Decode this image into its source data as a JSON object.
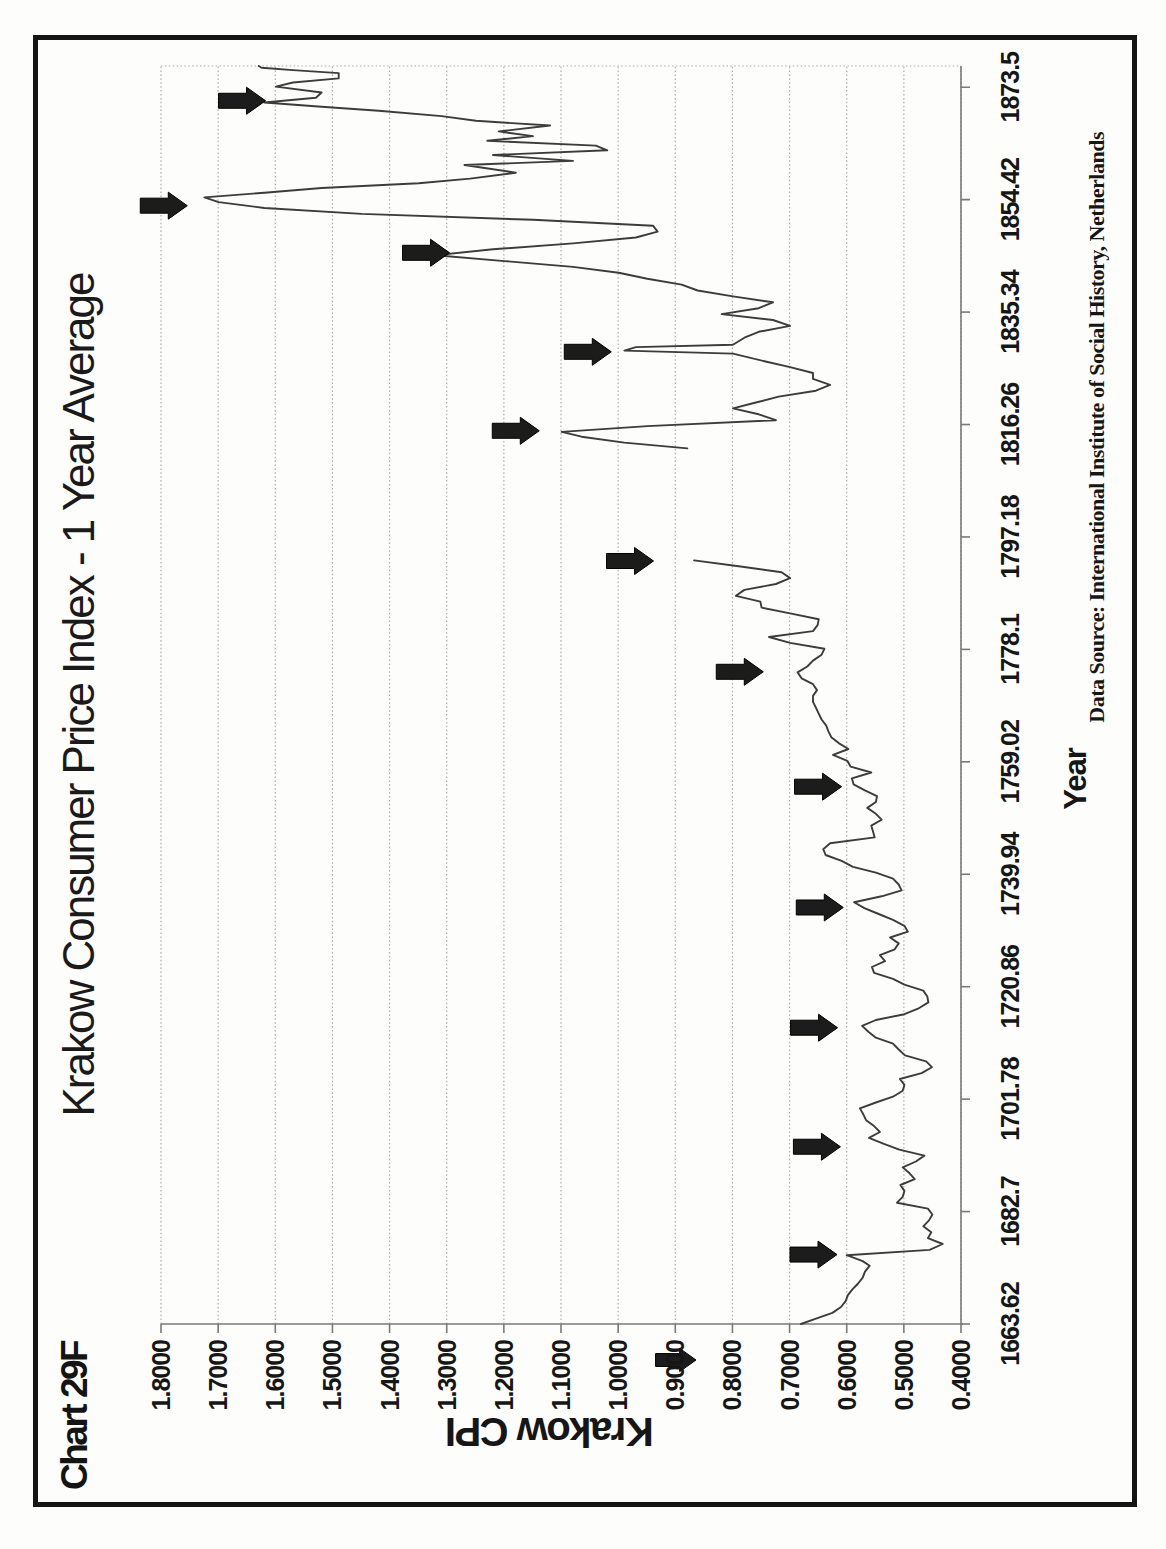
{
  "page": {
    "frame_label": "Chart 29F",
    "title": "Krakow Consumer Price Index - 1 Year Average",
    "source_note": "Data Source:  International Institute of Social History, Netherlands"
  },
  "axes": {
    "x_label": "Year",
    "y_label": "Krakow CPI",
    "x_tick_labels": [
      "1663.62",
      "1682.7",
      "1701.78",
      "1720.86",
      "1739.94",
      "1759.02",
      "1778.1",
      "1797.18",
      "1816.26",
      "1835.34",
      "1854.42",
      "1873.5"
    ],
    "y_tick_labels": [
      "1.8000",
      "1.7000",
      "1.6000",
      "1.5000",
      "1.4000",
      "1.3000",
      "1.2000",
      "1.1000",
      "1.0000",
      "0.9000",
      "0.8000",
      "0.7000",
      "0.6000",
      "0.5000",
      "0.4000"
    ]
  },
  "colors": {
    "ink": "#161616",
    "line": "#3c3c3c",
    "grid": "#ababab",
    "axis": "#7a7a7a",
    "arrow_fill": "#1c1c1c",
    "arrow_edge": "#000000",
    "frame": "#151515",
    "paper": "#fdfdfc"
  },
  "chart_data": {
    "type": "line",
    "title": "Krakow Consumer Price Index - 1 Year Average",
    "xlabel": "Year",
    "ylabel": "Krakow CPI",
    "x_ticks": [
      1663.62,
      1682.7,
      1701.78,
      1720.86,
      1739.94,
      1759.02,
      1778.1,
      1797.18,
      1816.26,
      1835.34,
      1854.42,
      1873.5
    ],
    "x_range": [
      1663.62,
      1877.1
    ],
    "y_ticks": [
      1.8,
      1.7,
      1.6,
      1.5,
      1.4,
      1.3,
      1.2,
      1.1,
      1.0,
      0.9,
      0.8,
      0.7,
      0.6,
      0.5,
      0.4
    ],
    "ylim": [
      0.4,
      1.8
    ],
    "grid": "value gridlines every 0.1, dotted",
    "legend": "none",
    "orientation_note": "chart printed rotated 90deg CCW on portrait page",
    "gap_years": [
      1794,
      1811
    ],
    "series": [
      {
        "name": "Krakow CPI (1 year average)",
        "segments": [
          [
            [
              1663.62,
              0.68
            ],
            [
              1664.5,
              0.655
            ],
            [
              1665.5,
              0.625
            ],
            [
              1666.5,
              0.61
            ],
            [
              1667.5,
              0.602
            ],
            [
              1668.5,
              0.598
            ],
            [
              1669.5,
              0.59
            ],
            [
              1670.5,
              0.58
            ],
            [
              1671.5,
              0.572
            ],
            [
              1672.5,
              0.568
            ],
            [
              1673.5,
              0.56
            ],
            [
              1674.3,
              0.572
            ],
            [
              1675.3,
              0.6
            ],
            [
              1676.2,
              0.455
            ],
            [
              1677.2,
              0.432
            ],
            [
              1678.2,
              0.458
            ],
            [
              1679.2,
              0.452
            ],
            [
              1680.2,
              0.466
            ],
            [
              1681.2,
              0.456
            ],
            [
              1682.2,
              0.45
            ],
            [
              1683.2,
              0.458
            ],
            [
              1684.2,
              0.512
            ],
            [
              1685.2,
              0.502
            ],
            [
              1686.2,
              0.499
            ],
            [
              1687.2,
              0.506
            ],
            [
              1688.2,
              0.481
            ],
            [
              1689.2,
              0.49
            ],
            [
              1690.2,
              0.502
            ],
            [
              1691.2,
              0.479
            ],
            [
              1692.2,
              0.464
            ],
            [
              1693.2,
              0.508
            ],
            [
              1694.2,
              0.535
            ],
            [
              1695.2,
              0.561
            ],
            [
              1696.2,
              0.542
            ],
            [
              1697.2,
              0.552
            ],
            [
              1698.2,
              0.566
            ],
            [
              1699.2,
              0.571
            ],
            [
              1700.2,
              0.577
            ],
            [
              1701.2,
              0.549
            ],
            [
              1702.2,
              0.519
            ],
            [
              1703.2,
              0.502
            ],
            [
              1704.2,
              0.499
            ],
            [
              1705.2,
              0.507
            ],
            [
              1706.2,
              0.469
            ],
            [
              1707.2,
              0.451
            ],
            [
              1708.2,
              0.461
            ],
            [
              1709.2,
              0.498
            ],
            [
              1710.2,
              0.509
            ],
            [
              1711.2,
              0.519
            ],
            [
              1712.2,
              0.549
            ],
            [
              1713.2,
              0.562
            ],
            [
              1714.2,
              0.573
            ],
            [
              1715.2,
              0.549
            ],
            [
              1716.2,
              0.499
            ],
            [
              1717.2,
              0.474
            ],
            [
              1718.2,
              0.457
            ],
            [
              1719.2,
              0.459
            ],
            [
              1720.2,
              0.466
            ],
            [
              1721.2,
              0.499
            ],
            [
              1722.2,
              0.519
            ],
            [
              1723.2,
              0.552
            ],
            [
              1724.2,
              0.556
            ],
            [
              1725.2,
              0.533
            ],
            [
              1726.2,
              0.542
            ],
            [
              1727.2,
              0.516
            ],
            [
              1728.2,
              0.509
            ],
            [
              1729.2,
              0.524
            ],
            [
              1730.2,
              0.493
            ],
            [
              1731.2,
              0.499
            ],
            [
              1732.2,
              0.519
            ],
            [
              1733.2,
              0.544
            ],
            [
              1734.2,
              0.569
            ],
            [
              1735.2,
              0.587
            ],
            [
              1736.2,
              0.539
            ],
            [
              1737.2,
              0.504
            ],
            [
              1738.2,
              0.509
            ],
            [
              1739.2,
              0.519
            ],
            [
              1740.2,
              0.549
            ],
            [
              1741.2,
              0.589
            ],
            [
              1742.2,
              0.609
            ],
            [
              1743.2,
              0.637
            ],
            [
              1744.2,
              0.641
            ],
            [
              1745.2,
              0.629
            ],
            [
              1746.2,
              0.551
            ],
            [
              1747.2,
              0.554
            ],
            [
              1748.2,
              0.557
            ],
            [
              1749.2,
              0.539
            ],
            [
              1750.2,
              0.549
            ],
            [
              1751.2,
              0.564
            ],
            [
              1752.2,
              0.549
            ],
            [
              1753.2,
              0.547
            ],
            [
              1754.2,
              0.569
            ],
            [
              1755.2,
              0.588
            ],
            [
              1756.2,
              0.591
            ],
            [
              1757.2,
              0.557
            ],
            [
              1758.2,
              0.593
            ],
            [
              1759.2,
              0.599
            ],
            [
              1760.2,
              0.624
            ],
            [
              1761.2,
              0.597
            ],
            [
              1762.2,
              0.614
            ],
            [
              1763.2,
              0.627
            ],
            [
              1764.2,
              0.632
            ],
            [
              1765.2,
              0.636
            ],
            [
              1766.2,
              0.644
            ],
            [
              1767.2,
              0.649
            ],
            [
              1768.2,
              0.654
            ],
            [
              1769.2,
              0.659
            ],
            [
              1770.2,
              0.659
            ],
            [
              1771.2,
              0.652
            ],
            [
              1772.2,
              0.659
            ],
            [
              1773.2,
              0.679
            ],
            [
              1774.2,
              0.686
            ],
            [
              1775.2,
              0.669
            ],
            [
              1776.2,
              0.659
            ],
            [
              1777.2,
              0.644
            ],
            [
              1778.2,
              0.639
            ],
            [
              1779.2,
              0.699
            ],
            [
              1780.2,
              0.736
            ],
            [
              1781.2,
              0.659
            ],
            [
              1782.2,
              0.651
            ],
            [
              1783.2,
              0.649
            ],
            [
              1784.2,
              0.699
            ],
            [
              1785.2,
              0.749
            ],
            [
              1786.2,
              0.751
            ],
            [
              1787.2,
              0.794
            ],
            [
              1788.2,
              0.779
            ],
            [
              1789.2,
              0.724
            ],
            [
              1790.2,
              0.699
            ],
            [
              1791.2,
              0.714
            ],
            [
              1792.2,
              0.789
            ],
            [
              1793.2,
              0.867
            ]
          ],
          [
            [
              1812.2,
              0.879
            ],
            [
              1813.2,
              0.989
            ],
            [
              1814.2,
              1.064
            ],
            [
              1815.0,
              1.099
            ],
            [
              1816.0,
              0.949
            ],
            [
              1817.0,
              0.724
            ],
            [
              1818.0,
              0.754
            ],
            [
              1819.0,
              0.799
            ],
            [
              1820.0,
              0.759
            ],
            [
              1821.0,
              0.719
            ],
            [
              1822.0,
              0.654
            ],
            [
              1823.0,
              0.629
            ],
            [
              1824.0,
              0.659
            ],
            [
              1825.0,
              0.659
            ],
            [
              1826.0,
              0.699
            ],
            [
              1827.0,
              0.744
            ],
            [
              1828.3,
              0.799
            ],
            [
              1828.8,
              0.989
            ],
            [
              1829.4,
              0.969
            ],
            [
              1829.8,
              0.799
            ],
            [
              1831.0,
              0.779
            ],
            [
              1832.0,
              0.754
            ],
            [
              1833.0,
              0.699
            ],
            [
              1834.0,
              0.729
            ],
            [
              1835.0,
              0.819
            ],
            [
              1836.0,
              0.754
            ],
            [
              1837.0,
              0.729
            ],
            [
              1838.0,
              0.799
            ],
            [
              1839.0,
              0.861
            ],
            [
              1840.0,
              0.889
            ],
            [
              1841.0,
              0.949
            ],
            [
              1842.0,
              0.999
            ],
            [
              1843.0,
              1.079
            ],
            [
              1844.0,
              1.199
            ],
            [
              1845.0,
              1.319
            ],
            [
              1846.0,
              1.219
            ],
            [
              1847.0,
              1.079
            ],
            [
              1848.0,
              0.969
            ],
            [
              1849.0,
              0.931
            ],
            [
              1850.0,
              0.939
            ],
            [
              1851.0,
              1.149
            ],
            [
              1852.0,
              1.449
            ],
            [
              1853.0,
              1.619
            ],
            [
              1854.0,
              1.699
            ],
            [
              1854.8,
              1.724
            ],
            [
              1855.6,
              1.619
            ],
            [
              1856.4,
              1.519
            ],
            [
              1857.2,
              1.349
            ],
            [
              1858.0,
              1.259
            ],
            [
              1859.0,
              1.179
            ],
            [
              1860.3,
              1.269
            ],
            [
              1861.0,
              1.079
            ],
            [
              1862.0,
              1.219
            ],
            [
              1862.8,
              1.019
            ],
            [
              1863.6,
              1.039
            ],
            [
              1864.4,
              1.229
            ],
            [
              1865.2,
              1.149
            ],
            [
              1866.0,
              1.209
            ],
            [
              1867.0,
              1.119
            ],
            [
              1867.8,
              1.249
            ],
            [
              1868.6,
              1.309
            ],
            [
              1869.5,
              1.419
            ],
            [
              1870.2,
              1.519
            ],
            [
              1870.9,
              1.619
            ],
            [
              1871.7,
              1.529
            ],
            [
              1872.6,
              1.519
            ],
            [
              1873.6,
              1.599
            ],
            [
              1874.3,
              1.569
            ],
            [
              1875.0,
              1.489
            ],
            [
              1875.9,
              1.489
            ],
            [
              1876.4,
              1.569
            ],
            [
              1876.8,
              1.624
            ],
            [
              1877.1,
              1.629
            ]
          ]
        ]
      }
    ],
    "event_arrows": [
      {
        "year": 1871.2,
        "cpi": 1.617
      },
      {
        "year": 1853.4,
        "cpi": 1.754
      },
      {
        "year": 1845.4,
        "cpi": 1.295
      },
      {
        "year": 1828.6,
        "cpi": 1.012
      },
      {
        "year": 1815.2,
        "cpi": 1.138
      },
      {
        "year": 1793.1,
        "cpi": 0.938
      },
      {
        "year": 1774.3,
        "cpi": 0.746
      },
      {
        "year": 1754.8,
        "cpi": 0.609
      },
      {
        "year": 1734.3,
        "cpi": 0.606
      },
      {
        "year": 1713.9,
        "cpi": 0.616
      },
      {
        "year": 1693.7,
        "cpi": 0.611
      },
      {
        "year": 1675.4,
        "cpi": 0.617
      }
    ],
    "label_overlay_arrow": {
      "on_y_tick": "0.9000",
      "tip_x": 142,
      "tip_y": 658
    }
  }
}
